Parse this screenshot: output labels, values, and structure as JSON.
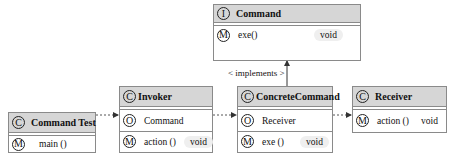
{
  "diagram": {
    "type": "UML class diagram",
    "classes": {
      "command": {
        "stereotype_icon": "I",
        "name": "Command",
        "members": [
          {
            "icon": "M",
            "label": "exe()",
            "type": "void"
          }
        ]
      },
      "command_test": {
        "stereotype_icon": "C",
        "name": "Command Test",
        "members": [
          {
            "icon": "M",
            "label": "main ()"
          }
        ]
      },
      "invoker": {
        "stereotype_icon": "C",
        "name": "Invoker",
        "members": [
          {
            "icon": "O",
            "label": "Command"
          },
          {
            "icon": "M",
            "label": "action ()",
            "type": "void"
          }
        ]
      },
      "concrete_command": {
        "stereotype_icon": "C",
        "name": "ConcreteCommand",
        "members": [
          {
            "icon": "O",
            "label": "Receiver"
          },
          {
            "icon": "M",
            "label": "exe ()",
            "type": "void"
          }
        ]
      },
      "receiver": {
        "stereotype_icon": "C",
        "name": "Receiver",
        "members": [
          {
            "icon": "M",
            "label": "action ()",
            "type": "void"
          }
        ]
      }
    },
    "relations": [
      {
        "from": "Command Test",
        "to": "Invoker",
        "style": "dashed-arrow"
      },
      {
        "from": "Invoker",
        "to": "ConcreteCommand",
        "style": "dashed-arrow"
      },
      {
        "from": "ConcreteCommand",
        "to": "Receiver",
        "style": "dashed-arrow"
      },
      {
        "from": "ConcreteCommand",
        "to": "Command",
        "style": "solid-arrow",
        "label": "< implements >"
      }
    ],
    "implements_label": "< implements >"
  }
}
